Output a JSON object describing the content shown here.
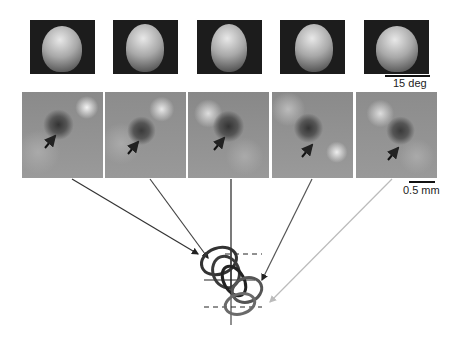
{
  "figure": {
    "faces": [
      {
        "view": "left-profile"
      },
      {
        "view": "left-three-quarter"
      },
      {
        "view": "frontal"
      },
      {
        "view": "right-three-quarter"
      },
      {
        "view": "right-profile"
      }
    ],
    "face_scale_label": "15 deg",
    "maps": [
      {
        "arrow_color": "#333333"
      },
      {
        "arrow_color": "#444444"
      },
      {
        "arrow_color": "#222222"
      },
      {
        "arrow_color": "#555555"
      },
      {
        "arrow_color": "#bbbbbb"
      }
    ],
    "map_scale_label": "0.5 mm",
    "contour_colors": [
      "#333333",
      "#3a3a3a",
      "#222222",
      "#555555",
      "#bbbbbb"
    ]
  }
}
